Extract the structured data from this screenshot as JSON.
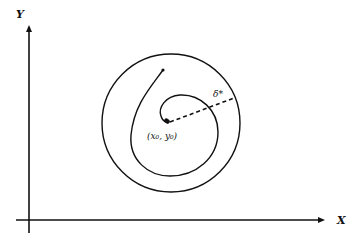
{
  "diagram": {
    "axes": {
      "x_label": "X",
      "y_label": "Y"
    },
    "center_label": "(x₀, y₀)",
    "radius_label": "δ*",
    "outer_circle": {
      "cx": 171,
      "cy": 123,
      "r": 69
    },
    "center_point": {
      "x": 168,
      "y": 122
    },
    "spiral_start_point": {
      "x": 163,
      "y": 70
    },
    "colors": {
      "stroke": "#111111",
      "background": "#ffffff"
    }
  }
}
